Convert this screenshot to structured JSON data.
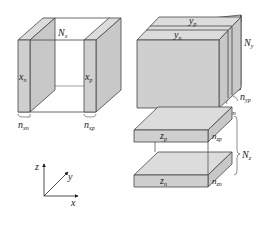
{
  "diagram": {
    "colors": {
      "face": "#cfcfcf",
      "face_light": "#dcdcdc",
      "edge": "#444444",
      "background": "#ffffff"
    },
    "x_boundaries": {
      "left_slab_label": "x",
      "left_slab_sub": "n",
      "right_slab_label": "x",
      "right_slab_sub": "p",
      "gap_label": "N",
      "gap_sub": "x",
      "left_thickness_label": "n",
      "left_thickness_sub": "xn",
      "right_thickness_label": "n",
      "right_thickness_sub": "xp"
    },
    "y_boundaries": {
      "back_slab_label": "y",
      "back_slab_sub": "p",
      "front_slab_label": "y",
      "front_slab_sub": "n",
      "gap_label": "N",
      "gap_sub": "y",
      "back_thickness_label": "n",
      "back_thickness_sub": "yp",
      "front_thickness_label": "n",
      "front_thickness_sub": "yn"
    },
    "z_boundaries": {
      "top_slab_label": "z",
      "top_slab_sub": "p",
      "bottom_slab_label": "z",
      "bottom_slab_sub": "n",
      "gap_label": "N",
      "gap_sub": "z",
      "top_thickness_label": "n",
      "top_thickness_sub": "zp",
      "bottom_thickness_label": "n",
      "bottom_thickness_sub": "zn"
    },
    "axes": {
      "z": "z",
      "y": "y",
      "x": "x"
    }
  }
}
